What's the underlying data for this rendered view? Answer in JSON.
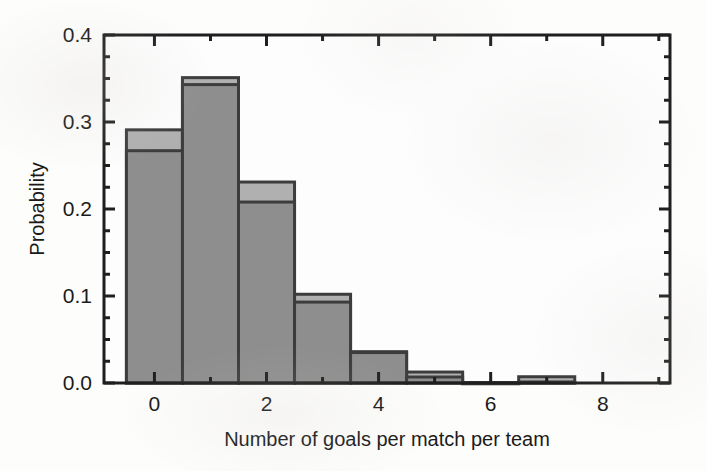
{
  "chart_data": {
    "type": "bar",
    "title": "",
    "subtitle": "",
    "xlabel": "Number of goals per match per team",
    "ylabel": "Probability",
    "xlim": [
      -0.9,
      9.2
    ],
    "ylim": [
      0.0,
      0.4
    ],
    "xticks": [
      0,
      2,
      4,
      6,
      8
    ],
    "xtick_labels": [
      "0",
      "2",
      "4",
      "6",
      "8"
    ],
    "xminor_ticks": [
      -1,
      1,
      3,
      5,
      7,
      9
    ],
    "yticks": [
      0.0,
      0.1,
      0.2,
      0.3,
      0.4
    ],
    "ytick_labels": [
      "0.0",
      "0.1",
      "0.2",
      "0.3",
      "0.4"
    ],
    "yminor_step": 0.025,
    "grid": false,
    "legend": "none",
    "bar_width": 1,
    "categories": [
      0,
      1,
      2,
      3,
      4,
      5,
      6,
      7,
      8
    ],
    "series": [
      {
        "name": "outer-histogram",
        "style": "outline-light-gray",
        "color": "#b0b0b0",
        "edge_color": "#3c3c3c",
        "values": [
          0.291,
          0.351,
          0.231,
          0.102,
          0.036,
          0.0126,
          0.0005,
          0.0072,
          0.0
        ]
      },
      {
        "name": "inner-histogram",
        "style": "filled-dark-gray",
        "color": "#8e8e8e",
        "edge_color": "#3c3c3c",
        "values": [
          0.267,
          0.343,
          0.208,
          0.093,
          0.035,
          0.0069,
          0.0003,
          0.0012,
          0.0
        ]
      }
    ]
  },
  "axes": {
    "frame_color": "#1f1f1f",
    "tick_direction": "in"
  }
}
